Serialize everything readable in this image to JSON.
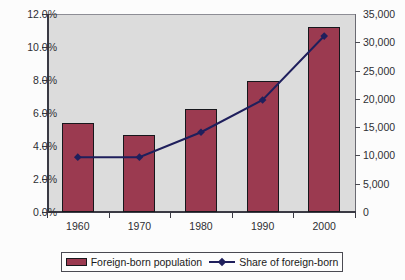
{
  "chart_data": {
    "type": "bar",
    "title": "",
    "subtitle": "",
    "xlabel": "",
    "ylabel": "",
    "categories": [
      "1960",
      "1970",
      "1980",
      "1990",
      "2000"
    ],
    "grid": false,
    "legend_position": "bottom",
    "series": [
      {
        "name": "Foreign-born population",
        "type": "bar",
        "axis": "left",
        "unit": "percent",
        "color": "#9B3A50",
        "values": [
          5.4,
          4.65,
          6.25,
          7.95,
          11.2
        ]
      },
      {
        "name": "Share of foreign-born",
        "type": "line",
        "axis": "right",
        "unit": "thousands",
        "color": "#1F1F5C",
        "values": [
          9700,
          9700,
          14100,
          19800,
          31100
        ]
      }
    ],
    "left_axis": {
      "label": "",
      "ylim": [
        0,
        12
      ],
      "ticks": [
        0,
        2,
        4,
        6,
        8,
        10,
        12
      ],
      "tick_labels": [
        "0.0%",
        "2.0%",
        "4.0%",
        "6.0%",
        "8.0%",
        "10.0%",
        "12.0%"
      ]
    },
    "right_axis": {
      "label": "",
      "ylim": [
        0,
        35000
      ],
      "ticks": [
        0,
        5000,
        10000,
        15000,
        20000,
        25000,
        30000,
        35000
      ],
      "tick_labels": [
        "0",
        "5,000",
        "10,000",
        "15,000",
        "20,000",
        "25,000",
        "30,000",
        "35,000"
      ]
    }
  },
  "legend": {
    "entries": [
      {
        "label": "Foreign-born population",
        "marker": "bar-swatch",
        "color": "#9B3A50"
      },
      {
        "label": "Share of foreign-born",
        "marker": "line-diamond",
        "color": "#1F1F5C"
      }
    ]
  },
  "colors": {
    "bar_fill": "#9B3A50",
    "bar_outline": "#17171C",
    "line": "#1F1F5C",
    "plot_background": "#DCDCDC",
    "canvas_background": "#FCFCFC",
    "axis": "#3A3A44",
    "text": "#2E2E33"
  }
}
